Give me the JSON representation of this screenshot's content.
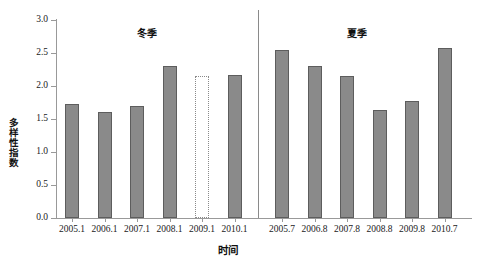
{
  "chart_data": {
    "type": "bar",
    "title": "",
    "xlabel": "时间",
    "ylabel": "多样性指数",
    "ylim": [
      0.0,
      3.0
    ],
    "ytick_labels": [
      "0.0",
      "0.5",
      "1.0",
      "1.5",
      "2.0",
      "2.5",
      "3.0"
    ],
    "ytick_values": [
      0.0,
      0.5,
      1.0,
      1.5,
      2.0,
      2.5,
      3.0
    ],
    "grid": false,
    "legend": "none",
    "groups": [
      {
        "name": "冬季",
        "categories": [
          "2005.1",
          "2006.1",
          "2007.1",
          "2008.1",
          "2009.1",
          "2010.1"
        ],
        "values": [
          1.72,
          1.61,
          1.69,
          2.31,
          2.15,
          2.16
        ],
        "missing_flags": [
          false,
          false,
          false,
          false,
          true,
          false
        ]
      },
      {
        "name": "夏季",
        "categories": [
          "2005.7",
          "2006.8",
          "2007.8",
          "2008.8",
          "2009.8",
          "2010.7"
        ],
        "values": [
          2.54,
          2.31,
          2.15,
          1.64,
          1.78,
          2.57
        ],
        "missing_flags": [
          false,
          false,
          false,
          false,
          false,
          false
        ]
      }
    ],
    "categories": [
      "2005.1",
      "2006.1",
      "2007.1",
      "2008.1",
      "2009.1",
      "2010.1",
      "2005.7",
      "2006.8",
      "2007.8",
      "2008.8",
      "2009.8",
      "2010.7"
    ],
    "values": [
      1.72,
      1.61,
      1.69,
      2.31,
      2.15,
      2.16,
      2.54,
      2.31,
      2.15,
      1.64,
      1.78,
      2.57
    ],
    "colors": {
      "bar_fill": "#8a8a8a",
      "bar_border": "#5d5d5d",
      "axis": "#999999",
      "text": "#1a1a1a",
      "divider": "#8a8a8a"
    },
    "annotations": [
      {
        "text": "冬季",
        "note": "winter group label"
      },
      {
        "text": "夏季",
        "note": "summer group label"
      },
      {
        "text": "2009.1",
        "note": "dotted outline bar indicating estimated/missing sample"
      }
    ]
  }
}
